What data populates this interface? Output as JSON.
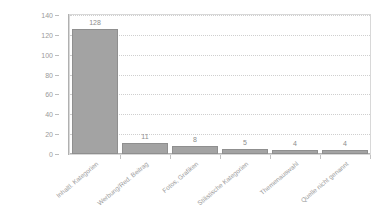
{
  "chart_data": {
    "type": "bar",
    "title": "",
    "subtitle": "",
    "xlabel": "",
    "ylabel": "",
    "ylim": [
      0,
      140
    ],
    "yticks": [
      0,
      20,
      40,
      60,
      80,
      100,
      120,
      140
    ],
    "grid": true,
    "legend": false,
    "legend_position": "none",
    "orientation": "vertical",
    "bar_color": "#a3a3a3",
    "bar_edge_color": "#8f8f8f",
    "gridline_color": "#cfcfcf",
    "axis_color": "#b0b0b0",
    "text_color": "#9b9b9b",
    "label_rotation": -40,
    "categories": [
      "Inhaltl. Kategorien",
      "Werbung/Red. Beitrag",
      "Fotos, Grafiken",
      "Stilistische Kategorien",
      "Themenauswahl",
      "Quelle nicht genannt"
    ],
    "values": [
      128,
      11,
      8,
      5,
      4,
      4
    ],
    "value_labels": [
      "128",
      "11",
      "8",
      "5",
      "4",
      "4"
    ],
    "ytick_labels": [
      "0",
      "20",
      "40",
      "60",
      "80",
      "100",
      "120",
      "140"
    ]
  }
}
